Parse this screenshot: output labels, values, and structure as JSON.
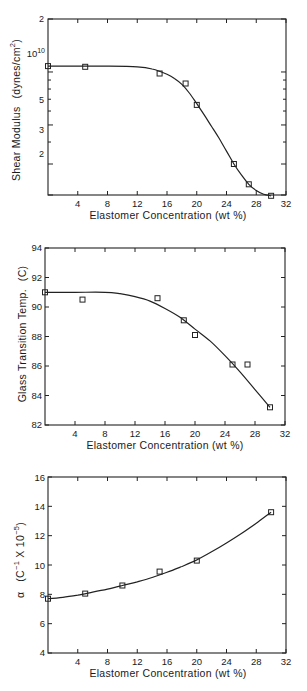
{
  "chart_data": [
    {
      "id": "shear-modulus",
      "type": "line",
      "title": "",
      "xlabel": "Elastomer Concentration (wt %)",
      "ylabel": "Shear Modulus",
      "ylabel_units": "(dynes/cm²)",
      "yscale": "log",
      "xlim": [
        0,
        32
      ],
      "ylim": [
        2000000000.0,
        20000000000.0
      ],
      "x_ticks": [
        4,
        8,
        12,
        16,
        20,
        24,
        28,
        32
      ],
      "y_tick_labels": [
        {
          "value": 20000000000.0,
          "label": "2"
        },
        {
          "value": 10000000000.0,
          "label": "10¹⁰"
        },
        {
          "value": 5000000000.0,
          "label": "5"
        },
        {
          "value": 3000000000.0,
          "label": "3"
        },
        {
          "value": 2000000000.0,
          "label": "2"
        }
      ],
      "grid": false,
      "marker": "open-square",
      "series": [
        {
          "name": "measured",
          "x": [
            0,
            5,
            15,
            18.5,
            20,
            25,
            27,
            30
          ],
          "y": [
            10800000000.0,
            10700000000.0,
            9800000000.0,
            8600000000.0,
            6500000000.0,
            3000000000.0,
            2300000000.0,
            1980000000.0
          ]
        }
      ],
      "fit_curve": {
        "x": [
          0,
          4,
          8,
          12,
          14,
          16,
          17,
          18,
          19,
          20,
          21,
          22,
          23,
          24,
          25,
          26,
          27,
          28,
          29,
          30
        ],
        "y": [
          10800000000.0,
          10800000000.0,
          10800000000.0,
          10700000000.0,
          10400000000.0,
          9700000000.0,
          9200000000.0,
          8500000000.0,
          7600000000.0,
          6600000000.0,
          5700000000.0,
          4900000000.0,
          4200000000.0,
          3550000000.0,
          3000000000.0,
          2600000000.0,
          2300000000.0,
          2120000000.0,
          2020000000.0,
          1980000000.0
        ]
      }
    },
    {
      "id": "glass-transition",
      "type": "line",
      "title": "",
      "xlabel": "Elastomer Concentration (wt %)",
      "ylabel": "Glass Transition Temp.",
      "ylabel_units": "(C)",
      "yscale": "linear",
      "xlim": [
        0,
        32
      ],
      "ylim": [
        82,
        94
      ],
      "x_ticks": [
        4,
        8,
        12,
        16,
        20,
        24,
        28,
        32
      ],
      "y_ticks": [
        82,
        84,
        86,
        88,
        90,
        92,
        94
      ],
      "grid": false,
      "marker": "open-square",
      "series": [
        {
          "name": "measured",
          "x": [
            0,
            5,
            15,
            18.5,
            20,
            25,
            27,
            30
          ],
          "y": [
            91.0,
            90.5,
            90.6,
            89.1,
            88.1,
            86.1,
            86.1,
            83.2
          ]
        }
      ],
      "fit_curve": {
        "x": [
          0,
          4,
          8,
          10,
          12,
          14,
          16,
          18,
          20,
          22,
          24,
          26,
          28,
          30
        ],
        "y": [
          91.0,
          91.0,
          91.0,
          90.9,
          90.7,
          90.4,
          89.9,
          89.3,
          88.5,
          87.7,
          86.7,
          85.6,
          84.4,
          83.2
        ]
      }
    },
    {
      "id": "expansion-coefficient",
      "type": "line",
      "title": "",
      "xlabel": "Elastomer Concentration (wt %)",
      "ylabel": "α",
      "ylabel_units": "(C⁻¹ X 10⁻⁵)",
      "yscale": "linear",
      "xlim": [
        0,
        32
      ],
      "ylim": [
        4,
        16
      ],
      "x_ticks": [
        4,
        8,
        12,
        16,
        20,
        24,
        28,
        32
      ],
      "y_ticks": [
        4,
        6,
        8,
        10,
        12,
        14,
        16
      ],
      "grid": false,
      "marker": "open-square",
      "series": [
        {
          "name": "measured",
          "x": [
            0,
            5,
            10,
            15,
            20,
            30
          ],
          "y": [
            7.7,
            8.05,
            8.6,
            9.55,
            10.3,
            13.6
          ]
        }
      ],
      "fit_curve": {
        "x": [
          0,
          2,
          4,
          6,
          8,
          10,
          12,
          14,
          16,
          18,
          20,
          22,
          24,
          26,
          28,
          30
        ],
        "y": [
          7.7,
          7.8,
          7.95,
          8.15,
          8.35,
          8.6,
          8.85,
          9.15,
          9.5,
          9.9,
          10.35,
          10.9,
          11.5,
          12.15,
          12.85,
          13.6
        ]
      }
    }
  ],
  "labels": {
    "chart1": {
      "ylabel": "Shear Modulus",
      "yunits": "(dynes/cm",
      "yunits_sup": "2",
      "yunits_close": ")",
      "xlabel": "Elastomer Concentration (wt %)",
      "x_ticks": [
        "4",
        "8",
        "12",
        "16",
        "20",
        "24",
        "28",
        "32"
      ],
      "y_top": "2",
      "y_1e10_base": "10",
      "y_1e10_exp": "10",
      "y_5": "5",
      "y_3": "3",
      "y_2": "2"
    },
    "chart2": {
      "ylabel": "Glass Transition Temp.",
      "yunits": "(C)",
      "xlabel": "Elastomer Concentration (wt %)",
      "x_ticks": [
        "4",
        "8",
        "12",
        "16",
        "20",
        "24",
        "28",
        "32"
      ],
      "y_ticks": [
        "82",
        "84",
        "86",
        "88",
        "90",
        "92",
        "94"
      ]
    },
    "chart3": {
      "ylabel": "α",
      "yunits_open": "(C",
      "yunits_sup1": "−1",
      "yunits_mid": " X 10",
      "yunits_sup2": "−5",
      "yunits_close": ")",
      "xlabel": "Elastomer Concentration (wt %)",
      "x_ticks": [
        "4",
        "8",
        "12",
        "16",
        "20",
        "24",
        "28",
        "32"
      ],
      "y_ticks": [
        "4",
        "6",
        "8",
        "10",
        "12",
        "14",
        "16"
      ]
    }
  }
}
